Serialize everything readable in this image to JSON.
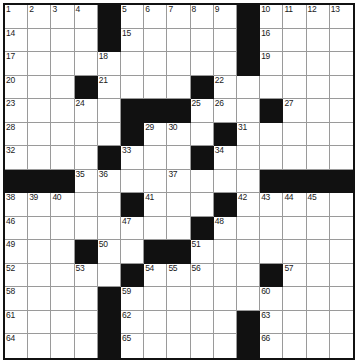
{
  "puzzle": {
    "type": "crossword-grid",
    "rows": 15,
    "columns": 15,
    "cell_size_px": 23.2,
    "colors": {
      "background": "#ffffff",
      "block": "#111111",
      "grid_line": "#9a9a9a",
      "border": "#111111",
      "number_text": "#1a1a1a"
    },
    "highest_clue_number": 66,
    "blocks": [
      [
        1,
        5
      ],
      [
        1,
        11
      ],
      [
        2,
        5
      ],
      [
        2,
        11
      ],
      [
        3,
        11
      ],
      [
        4,
        4
      ],
      [
        4,
        9
      ],
      [
        5,
        6
      ],
      [
        5,
        7
      ],
      [
        5,
        8
      ],
      [
        5,
        12
      ],
      [
        6,
        6
      ],
      [
        6,
        10
      ],
      [
        7,
        5
      ],
      [
        7,
        9
      ],
      [
        8,
        1
      ],
      [
        8,
        2
      ],
      [
        8,
        3
      ],
      [
        8,
        12
      ],
      [
        8,
        13
      ],
      [
        8,
        14
      ],
      [
        8,
        15
      ],
      [
        9,
        6
      ],
      [
        9,
        10
      ],
      [
        10,
        9
      ],
      [
        11,
        4
      ],
      [
        11,
        7
      ],
      [
        11,
        8
      ],
      [
        12,
        6
      ],
      [
        12,
        12
      ],
      [
        13,
        5
      ],
      [
        14,
        5
      ],
      [
        14,
        11
      ],
      [
        15,
        5
      ],
      [
        15,
        11
      ]
    ],
    "numbers": [
      {
        "n": 1,
        "row": 1,
        "col": 1
      },
      {
        "n": 2,
        "row": 1,
        "col": 2
      },
      {
        "n": 3,
        "row": 1,
        "col": 3
      },
      {
        "n": 4,
        "row": 1,
        "col": 4
      },
      {
        "n": 5,
        "row": 1,
        "col": 6
      },
      {
        "n": 6,
        "row": 1,
        "col": 7
      },
      {
        "n": 7,
        "row": 1,
        "col": 8
      },
      {
        "n": 8,
        "row": 1,
        "col": 9
      },
      {
        "n": 9,
        "row": 1,
        "col": 10
      },
      {
        "n": 10,
        "row": 1,
        "col": 12
      },
      {
        "n": 11,
        "row": 1,
        "col": 13
      },
      {
        "n": 12,
        "row": 1,
        "col": 14
      },
      {
        "n": 13,
        "row": 1,
        "col": 15
      },
      {
        "n": 14,
        "row": 2,
        "col": 1
      },
      {
        "n": 15,
        "row": 2,
        "col": 6
      },
      {
        "n": 16,
        "row": 2,
        "col": 12
      },
      {
        "n": 17,
        "row": 3,
        "col": 1
      },
      {
        "n": 18,
        "row": 3,
        "col": 5
      },
      {
        "n": 19,
        "row": 3,
        "col": 12
      },
      {
        "n": 20,
        "row": 4,
        "col": 1
      },
      {
        "n": 21,
        "row": 4,
        "col": 5
      },
      {
        "n": 22,
        "row": 4,
        "col": 10
      },
      {
        "n": 23,
        "row": 5,
        "col": 1
      },
      {
        "n": 24,
        "row": 5,
        "col": 4
      },
      {
        "n": 25,
        "row": 5,
        "col": 9
      },
      {
        "n": 26,
        "row": 5,
        "col": 10
      },
      {
        "n": 27,
        "row": 5,
        "col": 13
      },
      {
        "n": 28,
        "row": 6,
        "col": 1
      },
      {
        "n": 29,
        "row": 6,
        "col": 7
      },
      {
        "n": 30,
        "row": 6,
        "col": 8
      },
      {
        "n": 31,
        "row": 6,
        "col": 11
      },
      {
        "n": 32,
        "row": 7,
        "col": 1
      },
      {
        "n": 33,
        "row": 7,
        "col": 6
      },
      {
        "n": 34,
        "row": 7,
        "col": 10
      },
      {
        "n": 35,
        "row": 8,
        "col": 4
      },
      {
        "n": 36,
        "row": 8,
        "col": 5
      },
      {
        "n": 37,
        "row": 8,
        "col": 8
      },
      {
        "n": 38,
        "row": 9,
        "col": 1
      },
      {
        "n": 39,
        "row": 9,
        "col": 2
      },
      {
        "n": 40,
        "row": 9,
        "col": 3
      },
      {
        "n": 41,
        "row": 9,
        "col": 7
      },
      {
        "n": 42,
        "row": 9,
        "col": 11
      },
      {
        "n": 43,
        "row": 9,
        "col": 12
      },
      {
        "n": 44,
        "row": 9,
        "col": 13
      },
      {
        "n": 45,
        "row": 9,
        "col": 14
      },
      {
        "n": 46,
        "row": 10,
        "col": 1
      },
      {
        "n": 47,
        "row": 10,
        "col": 6
      },
      {
        "n": 48,
        "row": 10,
        "col": 10
      },
      {
        "n": 49,
        "row": 11,
        "col": 1
      },
      {
        "n": 50,
        "row": 11,
        "col": 5
      },
      {
        "n": 51,
        "row": 11,
        "col": 9
      },
      {
        "n": 52,
        "row": 12,
        "col": 1
      },
      {
        "n": 53,
        "row": 12,
        "col": 4
      },
      {
        "n": 54,
        "row": 12,
        "col": 7
      },
      {
        "n": 55,
        "row": 12,
        "col": 8
      },
      {
        "n": 56,
        "row": 12,
        "col": 9
      },
      {
        "n": 57,
        "row": 12,
        "col": 13
      },
      {
        "n": 58,
        "row": 13,
        "col": 1
      },
      {
        "n": 59,
        "row": 13,
        "col": 6
      },
      {
        "n": 60,
        "row": 13,
        "col": 12
      },
      {
        "n": 61,
        "row": 14,
        "col": 1
      },
      {
        "n": 62,
        "row": 14,
        "col": 6
      },
      {
        "n": 63,
        "row": 14,
        "col": 12
      },
      {
        "n": 64,
        "row": 15,
        "col": 1
      },
      {
        "n": 65,
        "row": 15,
        "col": 6
      },
      {
        "n": 66,
        "row": 15,
        "col": 12
      }
    ],
    "entries": []
  }
}
